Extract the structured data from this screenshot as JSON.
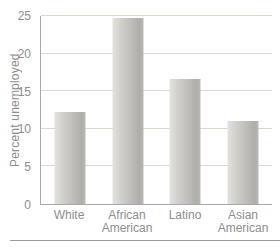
{
  "chart_data": {
    "type": "bar",
    "categories": [
      "White",
      "African American",
      "Latino",
      "Asian American"
    ],
    "values": [
      12.2,
      24.8,
      16.6,
      11.0
    ],
    "title": "",
    "xlabel": "",
    "ylabel": "Percent unemployed",
    "ylim": [
      0,
      25
    ],
    "yticks": [
      0,
      5,
      10,
      15,
      20,
      25
    ],
    "grid": true,
    "legend_position": "none"
  },
  "colors": {
    "background": "#ffffff",
    "text": "#8d8d8d",
    "gridline": "#d9d6cf",
    "axis": "#a9a9a9",
    "rule": "#9a9a9a",
    "bar_gradient": [
      "#e3e2df",
      "#d2d1ce",
      "#b9b8b5",
      "#aeadaa",
      "#bab9b6"
    ]
  }
}
